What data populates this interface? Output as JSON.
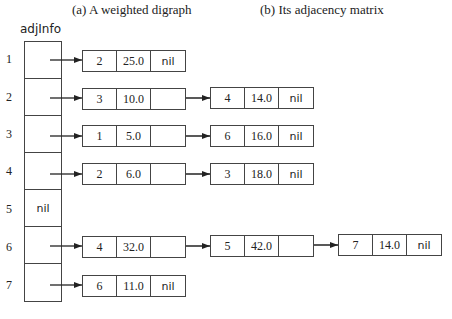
{
  "captions": {
    "a": "(a) A weighted digraph",
    "b": "(b) Its adjacency matrix"
  },
  "column_label": "adjInfo",
  "rows": [
    {
      "index": "1",
      "cell": "",
      "nodes": [
        {
          "vertex": "2",
          "weight": "25.0",
          "next": "nil"
        }
      ]
    },
    {
      "index": "2",
      "cell": "",
      "nodes": [
        {
          "vertex": "3",
          "weight": "10.0",
          "next": ""
        },
        {
          "vertex": "4",
          "weight": "14.0",
          "next": "nil"
        }
      ]
    },
    {
      "index": "3",
      "cell": "",
      "nodes": [
        {
          "vertex": "1",
          "weight": "5.0",
          "next": ""
        },
        {
          "vertex": "6",
          "weight": "16.0",
          "next": "nil"
        }
      ]
    },
    {
      "index": "4",
      "cell": "",
      "nodes": [
        {
          "vertex": "2",
          "weight": "6.0",
          "next": ""
        },
        {
          "vertex": "3",
          "weight": "18.0",
          "next": "nil"
        }
      ]
    },
    {
      "index": "5",
      "cell": "nil",
      "nodes": []
    },
    {
      "index": "6",
      "cell": "",
      "nodes": [
        {
          "vertex": "4",
          "weight": "32.0",
          "next": ""
        },
        {
          "vertex": "5",
          "weight": "42.0",
          "next": ""
        },
        {
          "vertex": "7",
          "weight": "14.0",
          "next": "nil"
        }
      ]
    },
    {
      "index": "7",
      "cell": "",
      "nodes": [
        {
          "vertex": "6",
          "weight": "11.0",
          "next": "nil"
        }
      ]
    }
  ]
}
